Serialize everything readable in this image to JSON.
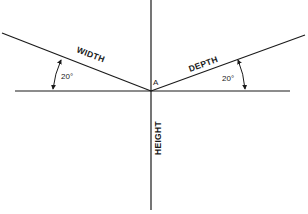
{
  "diagram": {
    "type": "isometric-axes",
    "origin_label": "A",
    "axes": [
      {
        "name": "width",
        "label": "WIDTH",
        "direction": "left-up"
      },
      {
        "name": "depth",
        "label": "DEPTH",
        "direction": "right-up"
      },
      {
        "name": "height",
        "label": "HEIGHT",
        "direction": "down"
      }
    ],
    "angles": [
      {
        "side": "left",
        "label": "20°"
      },
      {
        "side": "right",
        "label": "20°"
      }
    ]
  }
}
